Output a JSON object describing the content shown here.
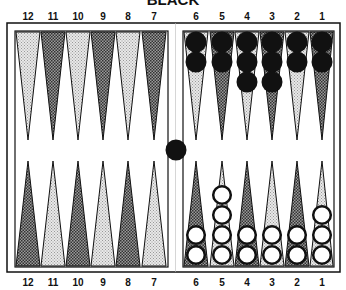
{
  "board": {
    "title": "BLACK",
    "top_labels": [
      "12",
      "11",
      "10",
      "9",
      "8",
      "7",
      "6",
      "5",
      "4",
      "3",
      "2",
      "1"
    ],
    "bottom_labels": [
      "12",
      "11",
      "10",
      "9",
      "8",
      "7",
      "6",
      "5",
      "4",
      "3",
      "2",
      "1"
    ],
    "colors": {
      "frame": "#111111",
      "light_point": "#d8d8d8",
      "dark_point": "#777777",
      "black_checker": "#111111",
      "white_checker": "#ffffff"
    },
    "black_checkers": {
      "6": 2,
      "5": 2,
      "4": 3,
      "3": 3,
      "2": 2,
      "1": 2
    },
    "white_checkers": {
      "6": 2,
      "5": 4,
      "4": 2,
      "3": 2,
      "2": 2,
      "1": 3
    },
    "bar": {
      "black": 1,
      "white": 0
    }
  }
}
